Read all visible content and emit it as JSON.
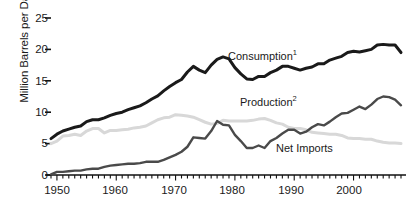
{
  "chart_data": {
    "type": "line",
    "title": "",
    "xlabel": "",
    "ylabel": "Million Barrels per Day",
    "xlim": [
      1949,
      2008
    ],
    "ylim": [
      0,
      25
    ],
    "yticks": [
      0,
      5,
      10,
      15,
      20,
      25
    ],
    "ytick_labels": [
      "0",
      "5",
      "10",
      "15",
      "20",
      "25"
    ],
    "xticks": [
      1950,
      1960,
      1970,
      1980,
      1990,
      2000
    ],
    "xtick_labels": [
      "1950",
      "1960",
      "1970",
      "1980",
      "1990",
      "2000"
    ],
    "minor_xticks": "every year 1949-2008",
    "grid": false,
    "legend_position": "inline-annotations",
    "x": [
      1949,
      1950,
      1951,
      1952,
      1953,
      1954,
      1955,
      1956,
      1957,
      1958,
      1959,
      1960,
      1961,
      1962,
      1963,
      1964,
      1965,
      1966,
      1967,
      1968,
      1969,
      1970,
      1971,
      1972,
      1973,
      1974,
      1975,
      1976,
      1977,
      1978,
      1979,
      1980,
      1981,
      1982,
      1983,
      1984,
      1985,
      1986,
      1987,
      1988,
      1989,
      1990,
      1991,
      1992,
      1993,
      1994,
      1995,
      1996,
      1997,
      1998,
      1999,
      2000,
      2001,
      2002,
      2003,
      2004,
      2005,
      2006,
      2007,
      2008
    ],
    "series": [
      {
        "name": "Consumption",
        "footnote": "1",
        "label": "Consumption",
        "color": "#1a1a1a",
        "linewidth": 3.0,
        "values": [
          5.8,
          6.5,
          7.0,
          7.3,
          7.6,
          7.8,
          8.5,
          8.8,
          8.8,
          9.1,
          9.5,
          9.8,
          10.0,
          10.4,
          10.7,
          11.0,
          11.5,
          12.1,
          12.6,
          13.4,
          14.1,
          14.7,
          15.2,
          16.4,
          17.3,
          16.7,
          16.3,
          17.5,
          18.4,
          18.8,
          18.5,
          17.1,
          16.1,
          15.3,
          15.2,
          15.7,
          15.7,
          16.3,
          16.7,
          17.3,
          17.3,
          17.0,
          16.7,
          17.0,
          17.2,
          17.7,
          17.7,
          18.3,
          18.6,
          18.9,
          19.5,
          19.7,
          19.6,
          19.8,
          20.0,
          20.7,
          20.8,
          20.7,
          20.7,
          19.5
        ]
      },
      {
        "name": "Production",
        "footnote": "2",
        "label": "Production",
        "color": "#d8d8d8",
        "linewidth": 3.0,
        "values": [
          5.0,
          5.4,
          6.2,
          6.3,
          6.5,
          6.3,
          7.0,
          7.4,
          7.4,
          6.7,
          7.1,
          7.1,
          7.2,
          7.3,
          7.5,
          7.6,
          7.8,
          8.3,
          8.8,
          9.1,
          9.2,
          9.6,
          9.5,
          9.4,
          9.2,
          8.8,
          8.4,
          8.1,
          8.2,
          8.7,
          8.6,
          8.6,
          8.6,
          8.6,
          8.7,
          8.9,
          9.0,
          8.7,
          8.3,
          8.1,
          7.6,
          7.4,
          7.4,
          7.2,
          6.8,
          6.7,
          6.6,
          6.5,
          6.5,
          6.3,
          5.9,
          5.8,
          5.8,
          5.7,
          5.7,
          5.4,
          5.2,
          5.1,
          5.1,
          5.0
        ]
      },
      {
        "name": "Net Imports",
        "footnote": "",
        "label": "Net Imports",
        "color": "#4a4a4a",
        "linewidth": 2.4,
        "values": [
          0.1,
          0.5,
          0.5,
          0.6,
          0.7,
          0.7,
          0.9,
          1.0,
          1.0,
          1.3,
          1.5,
          1.6,
          1.7,
          1.8,
          1.8,
          1.9,
          2.1,
          2.1,
          2.1,
          2.4,
          2.8,
          3.2,
          3.7,
          4.5,
          6.0,
          5.9,
          5.8,
          7.0,
          8.6,
          8.0,
          7.9,
          6.4,
          5.4,
          4.3,
          4.3,
          4.7,
          4.3,
          5.4,
          5.9,
          6.6,
          7.2,
          7.2,
          6.6,
          6.9,
          7.6,
          8.1,
          7.9,
          8.5,
          9.2,
          9.8,
          9.9,
          10.4,
          10.9,
          10.5,
          11.2,
          12.1,
          12.5,
          12.4,
          12.0,
          11.1
        ]
      }
    ]
  },
  "labels": {
    "y_axis_title": "Million Barrels per Day",
    "consumption": "Consumption",
    "consumption_sup": "1",
    "production": "Production",
    "production_sup": "2",
    "net_imports": "Net Imports",
    "ytick_0": "0",
    "ytick_5": "5",
    "ytick_10": "10",
    "ytick_15": "15",
    "ytick_20": "20",
    "ytick_25": "25",
    "xtick_1950": "1950",
    "xtick_1960": "1960",
    "xtick_1970": "1970",
    "xtick_1980": "1980",
    "xtick_1990": "1990",
    "xtick_2000": "2000"
  }
}
